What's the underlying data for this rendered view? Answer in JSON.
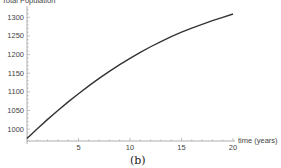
{
  "chart_data": {
    "type": "line",
    "title": "",
    "xlabel": "time (years)",
    "ylabel": "Total Population",
    "caption": "(b)",
    "xlim": [
      0,
      20
    ],
    "ylim": [
      968,
      1325
    ],
    "x_ticks": [
      5,
      10,
      15,
      20
    ],
    "y_ticks": [
      1000,
      1050,
      1100,
      1150,
      1200,
      1250,
      1300
    ],
    "x_minor_step": 1,
    "y_minor_step": 10,
    "grid": false,
    "series": [
      {
        "name": "Total Population",
        "color": "#333333",
        "x": [
          0,
          1,
          2,
          3,
          4,
          5,
          6,
          7,
          8,
          9,
          10,
          11,
          12,
          13,
          14,
          15,
          16,
          17,
          18,
          19,
          20
        ],
        "values": [
          975,
          1001,
          1026,
          1050,
          1073,
          1095,
          1116,
          1136,
          1155,
          1173,
          1190,
          1206,
          1221,
          1235,
          1248,
          1260,
          1271,
          1281,
          1291,
          1300,
          1309
        ]
      }
    ]
  }
}
